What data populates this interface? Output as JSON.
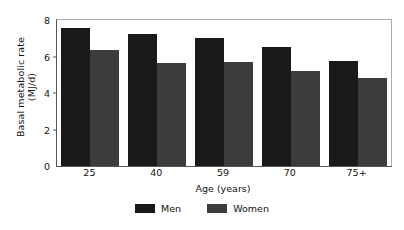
{
  "chart_data": {
    "type": "bar",
    "title": "",
    "xlabel": "Age (years)",
    "ylabel_line1": "Basal metabolic rate",
    "ylabel_line2": "(MJ/d)",
    "categories": [
      "25",
      "40",
      "59",
      "70",
      "75+"
    ],
    "series": [
      {
        "name": "Men",
        "color": "#191919",
        "values": [
          7.55,
          7.25,
          7.0,
          6.5,
          5.75
        ]
      },
      {
        "name": "Women",
        "color": "#3c3c3c",
        "values": [
          6.35,
          5.65,
          5.7,
          5.2,
          4.85
        ]
      }
    ],
    "ylim": [
      0,
      8
    ],
    "yticks": [
      "0",
      "2",
      "4",
      "6",
      "8"
    ],
    "ytick_values": [
      0,
      2,
      4,
      6,
      8
    ],
    "grid": false,
    "legend_position": "bottom-center"
  },
  "legend": {
    "items": [
      {
        "label": "Men"
      },
      {
        "label": "Women"
      }
    ]
  }
}
